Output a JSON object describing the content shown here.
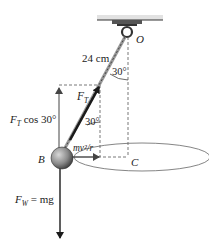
{
  "diagram": {
    "labels": {
      "pivot": "O",
      "length": "24 cm",
      "angle_top": "30°",
      "angle_force": "30°",
      "tension": "F",
      "tension_sub": "T",
      "tension_vertical": "F",
      "tension_vertical_sub": "T",
      "tension_vertical_rest": " cos 30°",
      "centripetal": "mv²/r",
      "ball": "B",
      "center": "C",
      "weight": "F",
      "weight_sub": "W",
      "weight_rest": " = mg"
    },
    "colors": {
      "line": "#222222",
      "dash": "#555555",
      "ceiling": "#d9d9d9",
      "ball_light": "#b8b8b8",
      "ball_dark": "#4a4a4a",
      "arrow": "#1a1a1a",
      "ellipse": "#666666"
    }
  }
}
